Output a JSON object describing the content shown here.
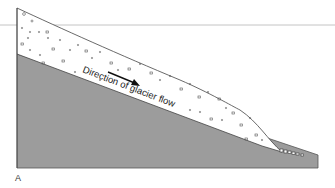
{
  "diagram": {
    "panel_label": "A",
    "flow_label": "Direction of glacier flow",
    "colors": {
      "bedrock": "#9a9a9a",
      "glacier": "#ffffff",
      "outline": "#444444",
      "rule": "#bdbdbd"
    }
  }
}
